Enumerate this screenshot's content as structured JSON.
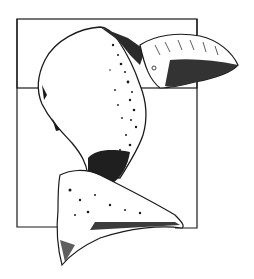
{
  "illustration": {
    "subject": "pen-and-ink drawing of an abstract sculptural form within a square frame",
    "colors": {
      "background": "#ffffff",
      "ink": "#1a1a1a"
    }
  }
}
